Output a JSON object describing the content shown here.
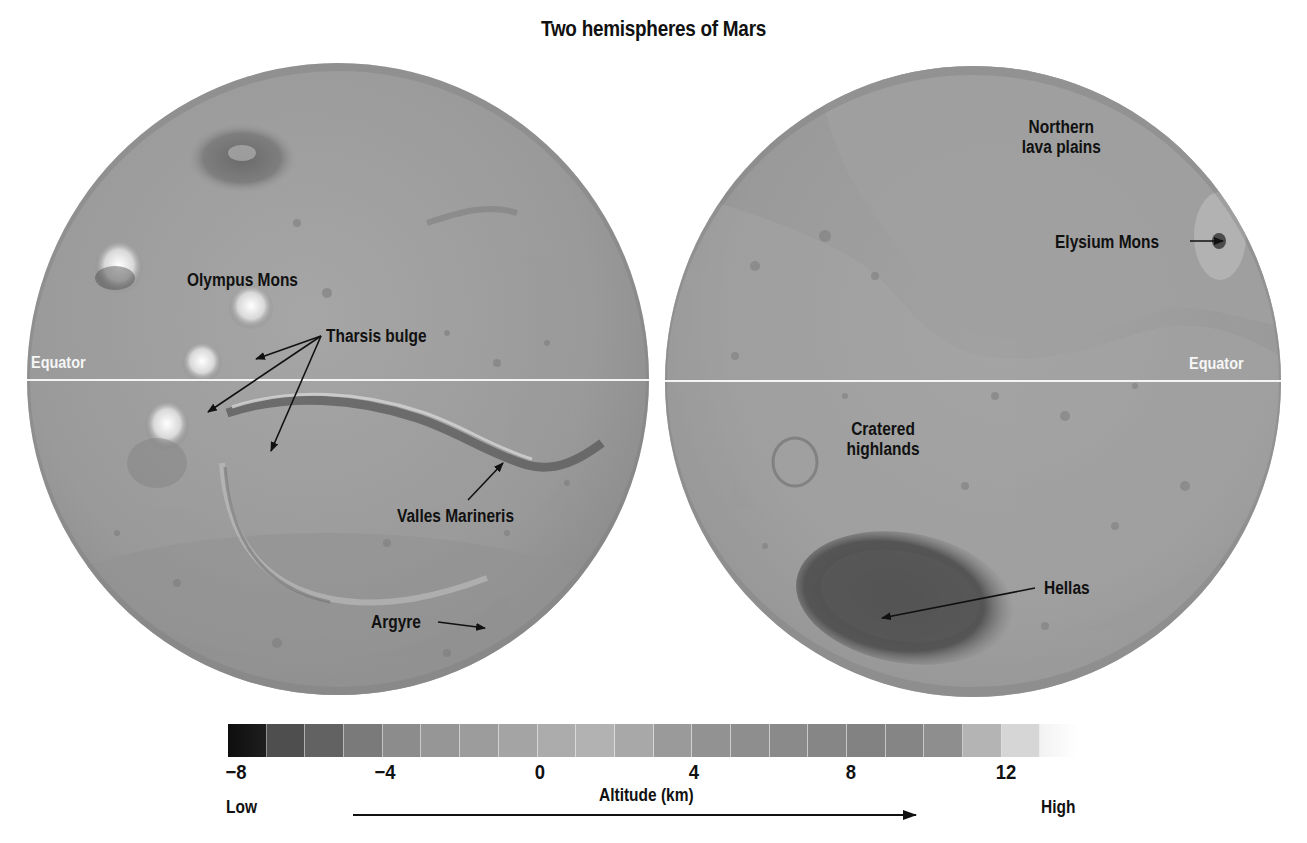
{
  "title": "Two hemispheres of Mars",
  "left_hemisphere": {
    "equator_label": "Equator",
    "labels": {
      "olympus_mons": "Olympus Mons",
      "tharsis_bulge": "Tharsis bulge",
      "valles_marineris": "Valles Marineris",
      "argyre": "Argyre"
    }
  },
  "right_hemisphere": {
    "equator_label": "Equator",
    "labels": {
      "northern_lava_plains_line1": "Northern",
      "northern_lava_plains_line2": "lava plains",
      "elysium_mons": "Elysium Mons",
      "cratered_highlands_line1": "Cratered",
      "cratered_highlands_line2": "highlands",
      "hellas": "Hellas"
    }
  },
  "colorbar": {
    "ticks": [
      "−8",
      "−4",
      "0",
      "4",
      "8",
      "12"
    ],
    "tick_values": [
      -8,
      -4,
      0,
      4,
      8,
      12
    ],
    "range_km": [
      -8,
      14
    ],
    "axis_label": "Altitude (km)",
    "low_label": "Low",
    "high_label": "High",
    "segment_colors": [
      "#1e1e1e",
      "#4e4e4e",
      "#626262",
      "#7a7a7a",
      "#8c8c8c",
      "#969696",
      "#9c9c9c",
      "#a4a4a4",
      "#acacac",
      "#b2b2b2",
      "#a8a8a8",
      "#9a9a9a",
      "#929292",
      "#8e8e8e",
      "#8a8a8a",
      "#868686",
      "#828282",
      "#858585",
      "#8e8e8e",
      "#b4b4b4",
      "#d6d6d6",
      "#f2f2f2"
    ]
  },
  "colors": {
    "globe_base": "#9e9e9e",
    "equator_line": "#f4f4f4",
    "label_text": "#111111",
    "background": "#ffffff"
  }
}
